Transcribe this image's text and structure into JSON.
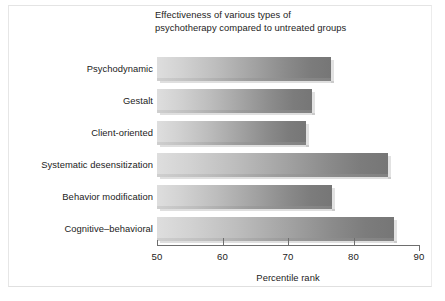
{
  "figure": {
    "title": "Effectiveness of various types of\npsychotherapy compared to untreated groups",
    "x_axis_label": "Percentile rank"
  },
  "chart_data": {
    "type": "bar",
    "orientation": "horizontal",
    "title": "Effectiveness of various types of psychotherapy compared to untreated groups",
    "xlabel": "Percentile rank",
    "ylabel": "",
    "xlim": [
      50,
      90
    ],
    "xticks": [
      50,
      60,
      70,
      80,
      90
    ],
    "xtick_labels": [
      "50",
      "60",
      "70",
      "80",
      "90"
    ],
    "grid": false,
    "legend": false,
    "bar_style": "horizontal gray gradient, light at left to dark at right",
    "categories": [
      "Psychodynamic",
      "Gestalt",
      "Client-oriented",
      "Systematic desensitization",
      "Behavior modification",
      "Cognitive–behavioral"
    ],
    "values": [
      76.6,
      73.7,
      72.8,
      85.3,
      76.7,
      86.2
    ],
    "bars": [
      {
        "label": "Psychodynamic",
        "value": 76.6
      },
      {
        "label": "Gestalt",
        "value": 73.7
      },
      {
        "label": "Client-oriented",
        "value": 72.8
      },
      {
        "label": "Systematic desensitization",
        "value": 85.3
      },
      {
        "label": "Behavior modification",
        "value": 76.7
      },
      {
        "label": "Cognitive–behavioral",
        "value": 86.2
      }
    ]
  },
  "colors": {
    "background": "#ffffff",
    "text": "#1b1b1b",
    "axis": "#6e6e6e",
    "bar_light": "#dedede",
    "bar_dark": "#767676"
  }
}
